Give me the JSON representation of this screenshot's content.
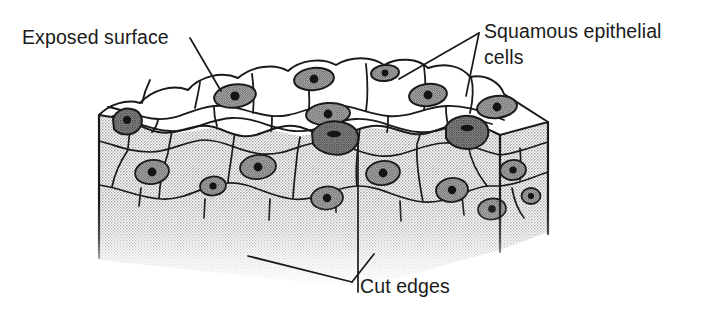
{
  "figure": {
    "background_color": "#ffffff",
    "ink_color": "#1a1a1a",
    "fill_top_surface": "#ffffff",
    "fill_cut_face": "#d9d9d9",
    "fill_nucleus": "#9a9a9a",
    "fill_nucleolus": "#141414",
    "fill_dark_cell": "#8a8a8a"
  },
  "labels": {
    "exposed_surface": {
      "text": "Exposed surface",
      "x": 22,
      "y": 44,
      "leader_count": 1
    },
    "squamous_cells": {
      "line1": "Squamous epithelial",
      "line2": "cells",
      "x": 484,
      "y1": 38,
      "y2": 64,
      "leader_count": 2
    },
    "cut_edges": {
      "text": "Cut edges",
      "x": 360,
      "y": 293,
      "leader_count": 2
    }
  },
  "diagram_content": {
    "type": "biological-illustration",
    "subject": "Simple squamous epithelium",
    "view": "three-dimensional cut block",
    "faces": [
      "top exposed surface",
      "front cut face",
      "right cut face"
    ],
    "features": [
      "flattened polygonal cells on exposed surface",
      "oval nuclei with central nucleoli",
      "stippled shading on cut edges",
      "basement region fading at bottom"
    ],
    "top_surface_nuclei": 9,
    "front_face_nuclei": 8,
    "right_face_nuclei": 2
  }
}
